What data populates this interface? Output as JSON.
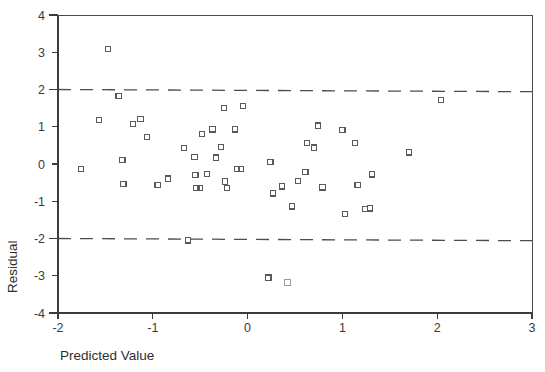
{
  "chart_data": {
    "type": "scatter",
    "title": "",
    "xlabel": "Predicted Value",
    "ylabel": "Residual",
    "xlim": [
      -2,
      3
    ],
    "ylim": [
      -4,
      4
    ],
    "xticks": [
      -2,
      -1,
      0,
      1,
      2,
      3
    ],
    "xticklabels": [
      "-2",
      "-1",
      "0",
      "1",
      "2",
      "3"
    ],
    "yticks": [
      -4,
      -3,
      -2,
      -1,
      0,
      1,
      2,
      3,
      4
    ],
    "yticklabels": [
      "-4",
      "-3",
      "-2",
      "-1",
      "0",
      "1",
      "2",
      "3",
      "4"
    ],
    "grid": false,
    "legend": null,
    "marker": "open-square",
    "marker_color": "#5a5a5a",
    "reference_lines": [
      {
        "name": "upper-limit",
        "orientation": "horizontal",
        "value": 2,
        "style": "dashed"
      },
      {
        "name": "lower-limit",
        "orientation": "horizontal",
        "value": -2,
        "style": "dashed"
      }
    ],
    "points": [
      {
        "x": -1.76,
        "y": -0.13
      },
      {
        "x": -1.57,
        "y": 1.18
      },
      {
        "x": -1.47,
        "y": 3.08
      },
      {
        "x": -1.36,
        "y": 1.83
      },
      {
        "x": -1.32,
        "y": 0.11
      },
      {
        "x": -1.31,
        "y": -0.53
      },
      {
        "x": -1.21,
        "y": 1.08
      },
      {
        "x": -1.13,
        "y": 1.21
      },
      {
        "x": -1.06,
        "y": 0.73
      },
      {
        "x": -0.95,
        "y": -0.56
      },
      {
        "x": -0.84,
        "y": -0.39
      },
      {
        "x": -0.67,
        "y": 0.43
      },
      {
        "x": -0.63,
        "y": -2.05
      },
      {
        "x": -0.56,
        "y": 0.19
      },
      {
        "x": -0.55,
        "y": -0.29
      },
      {
        "x": -0.54,
        "y": -0.65
      },
      {
        "x": -0.5,
        "y": -0.64
      },
      {
        "x": -0.48,
        "y": 0.81
      },
      {
        "x": -0.43,
        "y": -0.26
      },
      {
        "x": -0.37,
        "y": 0.93
      },
      {
        "x": -0.33,
        "y": 0.17
      },
      {
        "x": -0.28,
        "y": 0.45
      },
      {
        "x": -0.25,
        "y": 1.51
      },
      {
        "x": -0.24,
        "y": -0.47
      },
      {
        "x": -0.22,
        "y": -0.64
      },
      {
        "x": -0.13,
        "y": 0.93
      },
      {
        "x": -0.11,
        "y": -0.13
      },
      {
        "x": -0.07,
        "y": -0.14
      },
      {
        "x": -0.05,
        "y": 1.55
      },
      {
        "x": 0.22,
        "y": -3.05
      },
      {
        "x": 0.24,
        "y": 0.05
      },
      {
        "x": 0.27,
        "y": -0.79
      },
      {
        "x": 0.36,
        "y": -0.6
      },
      {
        "x": 0.42,
        "y": -3.18
      },
      {
        "x": 0.47,
        "y": -1.14
      },
      {
        "x": 0.53,
        "y": -0.45
      },
      {
        "x": 0.61,
        "y": -0.21
      },
      {
        "x": 0.63,
        "y": 0.57
      },
      {
        "x": 0.7,
        "y": 0.44
      },
      {
        "x": 0.74,
        "y": 1.03
      },
      {
        "x": 0.79,
        "y": -0.63
      },
      {
        "x": 1.0,
        "y": 0.91
      },
      {
        "x": 1.03,
        "y": -1.35
      },
      {
        "x": 1.13,
        "y": 0.56
      },
      {
        "x": 1.16,
        "y": -0.56
      },
      {
        "x": 1.24,
        "y": -1.21
      },
      {
        "x": 1.29,
        "y": -1.19
      },
      {
        "x": 1.31,
        "y": -0.28
      },
      {
        "x": 1.7,
        "y": 0.31
      },
      {
        "x": 2.04,
        "y": 1.72
      }
    ]
  }
}
